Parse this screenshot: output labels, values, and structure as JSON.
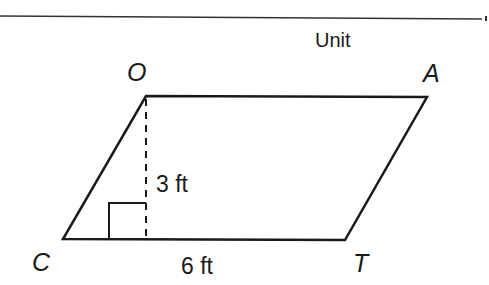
{
  "header": {
    "unit_label": "Unit"
  },
  "figure": {
    "shape": "parallelogram",
    "vertices": [
      {
        "name": "O",
        "x": 146,
        "y": 96
      },
      {
        "name": "A",
        "x": 427,
        "y": 97
      },
      {
        "name": "T",
        "x": 345,
        "y": 240
      },
      {
        "name": "C",
        "x": 63,
        "y": 239
      }
    ],
    "labels": {
      "O": "O",
      "A": "A",
      "T": "T",
      "C": "C"
    },
    "height_label": "3 ft",
    "base_label": "6 ft",
    "height_line_style": "dashed",
    "right_angle_marker": true,
    "stroke_color": "#1a1a1a"
  }
}
